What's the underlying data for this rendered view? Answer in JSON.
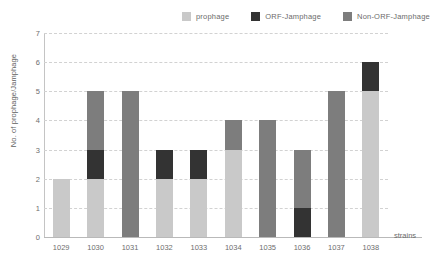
{
  "chart_data": {
    "type": "bar",
    "stacked": true,
    "title": "",
    "xlabel": "strains",
    "ylabel": "No. of prophage/Jamphage",
    "categories": [
      "1029",
      "1030",
      "1031",
      "1032",
      "1033",
      "1034",
      "1035",
      "1036",
      "1037",
      "1038"
    ],
    "ylim": [
      0,
      7
    ],
    "yticks": [
      "7",
      "6",
      "5",
      "4",
      "3",
      "2",
      "1",
      "0"
    ],
    "grid": true,
    "legend_position": "top-right",
    "series": [
      {
        "name": "prophage",
        "color": "#c9c9c9",
        "values": [
          2,
          2,
          0,
          2,
          2,
          3,
          0,
          0,
          0,
          5
        ]
      },
      {
        "name": "ORF-Jamphage",
        "color": "#333333",
        "values": [
          0,
          1,
          0,
          1,
          1,
          0,
          0,
          1,
          0,
          1
        ]
      },
      {
        "name": "Non-ORF-Jamphage",
        "color": "#7d7d7d",
        "values": [
          0,
          2,
          5,
          0,
          0,
          1,
          4,
          2,
          5,
          0
        ]
      }
    ],
    "totals": [
      2,
      5,
      5,
      3,
      3,
      4,
      4,
      3,
      5,
      6
    ]
  }
}
